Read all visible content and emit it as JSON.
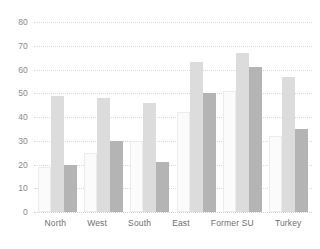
{
  "chart_data": {
    "type": "bar",
    "title": "",
    "subtitle": "",
    "xlabel": "",
    "ylabel": "",
    "ylim": [
      0,
      80
    ],
    "ytick_step": 10,
    "yticks": [
      0,
      10,
      20,
      30,
      40,
      50,
      60,
      70,
      80
    ],
    "ytick_labels": [
      "0",
      "10",
      "20",
      "30",
      "40",
      "50",
      "60",
      "70",
      "80"
    ],
    "grid": true,
    "grid_style": "dotted-horizontal",
    "legend": false,
    "legend_position": "none",
    "categories": [
      "North",
      "West",
      "South",
      "East",
      "Former SU",
      "Turkey"
    ],
    "series": [
      {
        "name": "series-1",
        "color": "#fbfbfb",
        "values": [
          19,
          25,
          30,
          42,
          51,
          32
        ]
      },
      {
        "name": "series-2",
        "color": "#dcdcdc",
        "values": [
          49,
          48,
          46,
          63,
          67,
          57
        ]
      },
      {
        "name": "series-3",
        "color": "#b4b4b4",
        "values": [
          20,
          30,
          21,
          50,
          61,
          35
        ]
      }
    ],
    "annotations": []
  },
  "axis": {
    "tick_color": "#8a8a8a",
    "label_color": "#6f6f6f",
    "grid_color": "#d9d9d9"
  },
  "background": "#ffffff"
}
